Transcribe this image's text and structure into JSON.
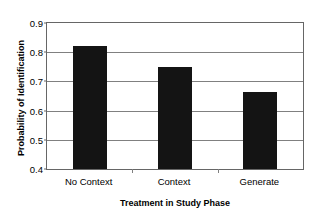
{
  "chart_data": {
    "type": "bar",
    "title": "",
    "categories": [
      "No Context",
      "Context",
      "Generate"
    ],
    "values": [
      0.82,
      0.75,
      0.665
    ],
    "xlabel": "Treatment in Study Phase",
    "ylabel": "Probability of Identification",
    "ylim": [
      0.4,
      0.9
    ],
    "yticks": [
      "0.4",
      "0.5",
      "0.6",
      "0.7",
      "0.8",
      "0.9"
    ],
    "ytick_values": [
      0.4,
      0.5,
      0.6,
      0.7,
      0.8,
      0.9
    ],
    "grid": "horizontal",
    "legend": "none",
    "bar_color": "#141414",
    "gridline_color": "#808080",
    "axis_color": "#666666",
    "background": "#ffffff"
  }
}
